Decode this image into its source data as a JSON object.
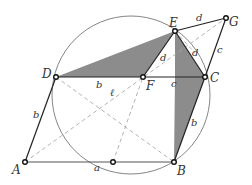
{
  "diagram": {
    "type": "geometry-construction",
    "colors": {
      "shade": "#8c8c8c",
      "solid_line": "#222222",
      "dashed_line": "#aaaaaa",
      "circle": "#777777"
    },
    "points": [
      {
        "name": "A",
        "x": 25,
        "y": 162
      },
      {
        "name": "B",
        "x": 174,
        "y": 162
      },
      {
        "name": "C",
        "x": 205,
        "y": 77
      },
      {
        "name": "D",
        "x": 56,
        "y": 77
      },
      {
        "name": "E",
        "x": 175,
        "y": 31
      },
      {
        "name": "F",
        "x": 143,
        "y": 77
      },
      {
        "name": "G",
        "x": 226,
        "y": 18
      },
      {
        "name": "",
        "x": 113,
        "y": 162
      }
    ],
    "point_labels": {
      "A": "A",
      "B": "B",
      "C": "C",
      "D": "D",
      "E": "E",
      "F": "F",
      "G": "G"
    },
    "segment_labels": {
      "AD": "b",
      "AB": "a",
      "DF": "b",
      "FC": "c",
      "EF": "d",
      "EC": "d",
      "EG": "d",
      "GC": "c",
      "CB": "b",
      "diag": "ℓ"
    }
  }
}
